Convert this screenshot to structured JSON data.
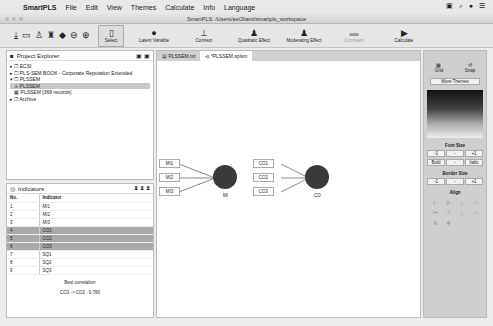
{
  "menubar": {
    "app": "SmartPLS",
    "items": [
      "File",
      "Edit",
      "View",
      "Themes",
      "Calculate",
      "Info",
      "Language"
    ]
  },
  "window": {
    "title": "SmartPLS: /Users/aeOliami/smartpls_workspace"
  },
  "toolbar": {
    "tools": [
      {
        "label": "Select",
        "icon": "cursor-icon"
      },
      {
        "label": "Latent Variable",
        "icon": "latent-variable-icon"
      },
      {
        "label": "Connect",
        "icon": "connect-icon"
      },
      {
        "label": "Quadratic Effect",
        "icon": "quadratic-effect-icon"
      },
      {
        "label": "Moderating Effect",
        "icon": "moderating-effect-icon"
      },
      {
        "label": "Comment",
        "icon": "comment-icon"
      },
      {
        "label": "Calculate",
        "icon": "play-icon"
      }
    ]
  },
  "project_explorer": {
    "title": "Project Explorer",
    "items": [
      "ECSI",
      "PLS-SEM BOOK - Corporate Reputation Extended",
      "PLSSEM",
      "PLSSEM",
      "PLSSEM [368 records]",
      "Archive"
    ]
  },
  "indicators": {
    "title": "Indicators",
    "headers": [
      "No.",
      "Indicator"
    ],
    "rows": [
      [
        "1",
        "MI1"
      ],
      [
        "2",
        "MI2"
      ],
      [
        "3",
        "MI3"
      ],
      [
        "4",
        "CO1"
      ],
      [
        "5",
        "CO2"
      ],
      [
        "6",
        "CO3"
      ],
      [
        "7",
        "SQ1"
      ],
      [
        "8",
        "SQ2"
      ],
      [
        "9",
        "SQ3"
      ]
    ],
    "best_label": "Best correlation",
    "best_value": "CO3 -> CO2 : 0.780"
  },
  "tabs": [
    "PLSSEM.txt",
    "*PLSSEM.splsm"
  ],
  "model": {
    "mi": {
      "label": "MI",
      "indicators": [
        "MI1",
        "MI2",
        "MI3"
      ]
    },
    "co": {
      "label": "CO",
      "indicators": [
        "CO1",
        "CO2",
        "CO3"
      ]
    }
  },
  "side": {
    "grid": "Grid",
    "snap": "Snap",
    "more_themes": "More Themes",
    "font_size": "Font Size",
    "border_size": "Border Size",
    "align": "Align",
    "minus": "-1",
    "dash": "-",
    "plus": "+1",
    "bold": "Bold",
    "italic": "Italic"
  }
}
